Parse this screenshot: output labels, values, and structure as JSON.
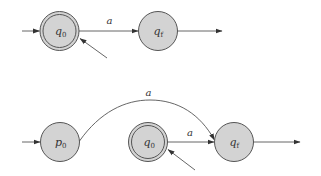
{
  "diagrams": [
    {
      "name": "automaton-top",
      "states": [
        {
          "id": "q0",
          "base": "q",
          "sub": "0",
          "accepting": true,
          "cx": 59.5,
          "cy": 31
        },
        {
          "id": "qf",
          "base": "q",
          "sub": "f",
          "accepting": false,
          "cx": 158,
          "cy": 31
        }
      ],
      "edges": [
        {
          "from": "q0",
          "to": "qf",
          "label": "a"
        }
      ]
    },
    {
      "name": "automaton-bottom",
      "states": [
        {
          "id": "p0",
          "base": "p",
          "sub": "0",
          "accepting": false,
          "cx": 60,
          "cy": 142
        },
        {
          "id": "q0",
          "base": "q",
          "sub": "0",
          "accepting": true,
          "cx": 148,
          "cy": 142
        },
        {
          "id": "qf",
          "base": "q",
          "sub": "f",
          "accepting": false,
          "cx": 234,
          "cy": 142
        }
      ],
      "edges": [
        {
          "from": "p0",
          "to": "qf",
          "label": "a",
          "curved": true
        },
        {
          "from": "q0",
          "to": "qf",
          "label": "a"
        }
      ]
    }
  ],
  "labels": {
    "top_q0_base": "q",
    "top_q0_sub": "0",
    "top_qf_base": "q",
    "top_qf_sub": "f",
    "top_edge_a": "a",
    "bot_p0_base": "p",
    "bot_p0_sub": "0",
    "bot_q0_base": "q",
    "bot_q0_sub": "0",
    "bot_qf_base": "q",
    "bot_qf_sub": "f",
    "bot_arc_a": "a",
    "bot_edge_a": "a"
  },
  "colors": {
    "state_fill": "#d3d3d3",
    "stroke": "#555555"
  }
}
